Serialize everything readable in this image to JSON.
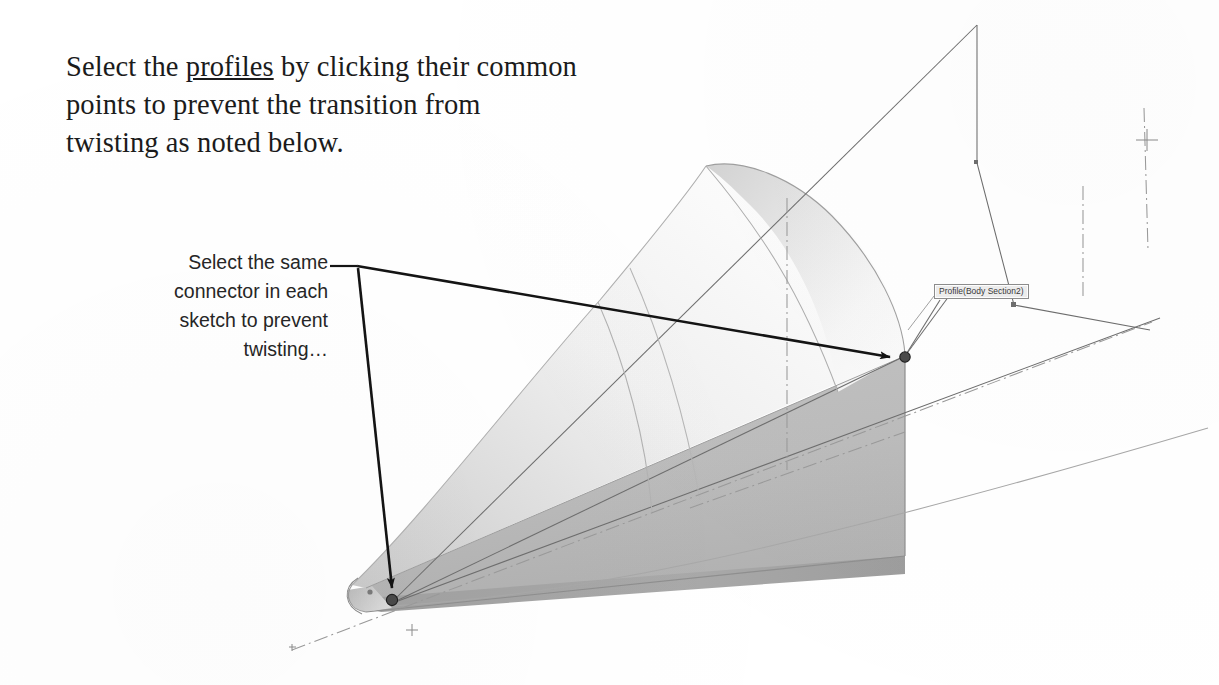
{
  "page": {
    "width": 1219,
    "height": 685,
    "background": "#ffffff"
  },
  "instruction": {
    "name": "instruction-paragraph",
    "line1_before": "Select the ",
    "line1_underlined": "profiles",
    "line1_after": " by clicking their common",
    "line2": "points to prevent the transition from",
    "line3": "twisting as noted below.",
    "full_text": "Select the profiles by clicking their common points to prevent the transition from twisting as noted below."
  },
  "callout": {
    "name": "twisting-callout",
    "line1": "Select the same",
    "line2": "connector in each",
    "line3": "sketch to prevent",
    "line4": "twisting…",
    "full_text": "Select the same connector in each sketch to prevent twisting…"
  },
  "tooltip": {
    "name": "profile-tooltip",
    "label": "Profile(Body Section2)",
    "border_color": "#8d8d8d",
    "fill_color": "#eeeeee"
  },
  "viewport": {
    "name": "cad-viewport",
    "model_type": "lofted-solid",
    "description": "Tapered lofted solid running lower-left to upper-right with a rounded dome top surface, shown with sketch profile wireframes and dash-dot centerlines."
  },
  "annotations": {
    "leader_stub_label": "callout-leader-stub",
    "arrow_to_tip_label": "arrow-to-near-connector",
    "arrow_to_section_label": "arrow-to-far-connector",
    "connector_near_label": "connector-point-near",
    "connector_far_label": "connector-point-far"
  },
  "colors": {
    "ink": "#1b1b1b",
    "callout_ink": "#262626",
    "arrow": "#141414",
    "sketch_line": "#6e6e6e",
    "centerline": "#9a9a9a",
    "body_light": "#fdfdfd",
    "body_mid": "#d6d6d6",
    "body_shadow": "#b5b5b5",
    "body_dark_edge": "#9b9b9b",
    "tooltip_border": "#8d8d8d"
  }
}
